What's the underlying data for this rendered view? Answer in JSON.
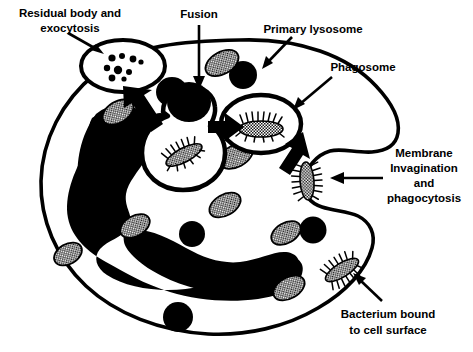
{
  "figure": {
    "type": "biological-diagram",
    "background_color": "#ffffff",
    "ink_color": "#000000",
    "granule_fill_color": "#8c8c8c"
  },
  "labels": {
    "residual_body": {
      "lines": [
        "Residual body and",
        "exocytosis"
      ],
      "line1": "Residual body and",
      "line2": "exocytosis"
    },
    "fusion": {
      "lines": [
        "Fusion"
      ],
      "line1": "Fusion"
    },
    "primary_lysosome": {
      "lines": [
        "Primary lysosome"
      ],
      "line1": "Primary lysosome"
    },
    "phagosome": {
      "lines": [
        "Phagosome"
      ],
      "line1": "Phagosome"
    },
    "membrane_invagination": {
      "lines": [
        "Membrane",
        "Invagination",
        "and",
        "phagocytosis"
      ],
      "line1": "Membrane",
      "line2": "Invagination",
      "line3": "and",
      "line4": "phagocytosis"
    },
    "bacterium_bound": {
      "lines": [
        "Bacterium bound",
        "to cell surface"
      ],
      "line1": "Bacterium bound",
      "line2": "to cell surface"
    }
  },
  "structures": {
    "cell_membrane": "cell-membrane-outline",
    "nucleus": "lobed-nucleus",
    "dark_granules_count": 8,
    "hatched_granules_count": 8,
    "bacteria_count": 4,
    "phagosomes_count": 2,
    "residual_body_debris_count": 9
  }
}
